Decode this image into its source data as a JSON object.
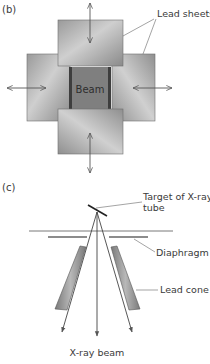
{
  "panel_b": {
    "label": "(b)",
    "callout_lead_sheets": "Lead sheets",
    "beam_label": "Beam"
  },
  "panel_c": {
    "label": "(c)",
    "callout_target_line1": "Target of X-ray",
    "callout_target_line2": "tube",
    "callout_diaphragm": "Diaphragm",
    "callout_lead_cone": "Lead cone",
    "beam_caption": "X-ray beam"
  },
  "colors": {
    "sheet_light": "#c8c8c8",
    "sheet_dark": "#8e8e8e",
    "beam_fill": "#7d7d7d",
    "beam_edge": "#3a3a3a",
    "line": "#555555"
  }
}
